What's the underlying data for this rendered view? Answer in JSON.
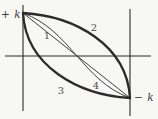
{
  "figure": {
    "background_color": "#f7f7f4",
    "line_color": "#2b2b2b",
    "axis_label_color": "#3a3a3a",
    "curve_label_color": "#4d4d4d",
    "axis_labels": {
      "top_left": "+ k",
      "bottom_right": "− k"
    },
    "curve_labels": {
      "c1": "1",
      "c2": "2",
      "c3": "3",
      "c4": "4"
    }
  }
}
